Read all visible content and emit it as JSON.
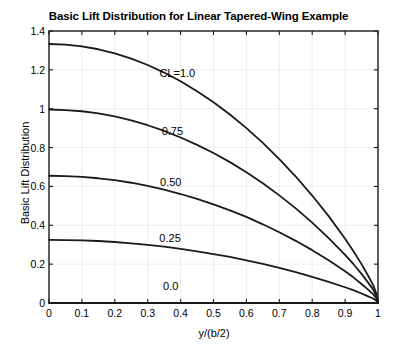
{
  "chart_data": {
    "type": "line",
    "title": "Basic Lift Distribution for Linear Tapered-Wing Example",
    "xlabel": "y/(b/2)",
    "ylabel": "Basic Lift Distribution",
    "xlim": [
      0,
      1
    ],
    "ylim": [
      0,
      1.4
    ],
    "xticks": [
      "0",
      "0.1",
      "0.2",
      "0.3",
      "0.4",
      "0.5",
      "0.6",
      "0.7",
      "0.8",
      "0.9",
      "1"
    ],
    "xtick_values": [
      0,
      0.1,
      0.2,
      0.3,
      0.4,
      0.5,
      0.6,
      0.7,
      0.8,
      0.9,
      1
    ],
    "yticks": [
      "0",
      "0.2",
      "0.4",
      "0.6",
      "0.8",
      "1",
      "1.2",
      "1.4"
    ],
    "ytick_values": [
      0,
      0.2,
      0.4,
      0.6,
      0.8,
      1.0,
      1.2,
      1.4
    ],
    "grid": true,
    "legend_position": "inline-annotations",
    "line_color": "#1a1a1a",
    "line_width": 1.8,
    "x": [
      0,
      0.05,
      0.1,
      0.15,
      0.2,
      0.25,
      0.3,
      0.35,
      0.4,
      0.45,
      0.5,
      0.55,
      0.6,
      0.65,
      0.7,
      0.75,
      0.8,
      0.85,
      0.9,
      0.925,
      0.95,
      0.97,
      0.985,
      0.995,
      1
    ],
    "series": [
      {
        "name": "CL=1.0",
        "label": "CL=1.0",
        "label_x": 0.39,
        "label_y": 1.185,
        "values": [
          1.333,
          1.33,
          1.321,
          1.306,
          1.285,
          1.258,
          1.225,
          1.186,
          1.141,
          1.09,
          1.033,
          0.97,
          0.9,
          0.824,
          0.741,
          0.651,
          0.553,
          0.447,
          0.331,
          0.268,
          0.2,
          0.14,
          0.093,
          0.048,
          0.0
        ]
      },
      {
        "name": "0.75",
        "label": "0.75",
        "label_x": 0.375,
        "label_y": 0.885,
        "values": [
          0.996,
          0.993,
          0.987,
          0.976,
          0.96,
          0.94,
          0.915,
          0.886,
          0.852,
          0.814,
          0.772,
          0.725,
          0.673,
          0.616,
          0.554,
          0.487,
          0.414,
          0.334,
          0.248,
          0.201,
          0.15,
          0.105,
          0.07,
          0.036,
          0.0
        ]
      },
      {
        "name": "0.50",
        "label": "0.50",
        "label_x": 0.37,
        "label_y": 0.625,
        "values": [
          0.655,
          0.653,
          0.649,
          0.642,
          0.632,
          0.619,
          0.603,
          0.583,
          0.561,
          0.536,
          0.508,
          0.477,
          0.443,
          0.405,
          0.364,
          0.32,
          0.272,
          0.22,
          0.163,
          0.132,
          0.098,
          0.069,
          0.046,
          0.024,
          0.0
        ]
      },
      {
        "name": "0.25",
        "label": "0.25",
        "label_x": 0.368,
        "label_y": 0.335,
        "values": [
          0.325,
          0.324,
          0.322,
          0.319,
          0.314,
          0.307,
          0.299,
          0.29,
          0.279,
          0.266,
          0.252,
          0.237,
          0.22,
          0.201,
          0.181,
          0.159,
          0.135,
          0.109,
          0.081,
          0.066,
          0.049,
          0.034,
          0.023,
          0.012,
          0.0
        ]
      },
      {
        "name": "0.0",
        "label": "0.0",
        "label_x": 0.37,
        "label_y": 0.085,
        "values": [
          0.0,
          0.0,
          0.0,
          0.0,
          0.0,
          0.0,
          0.0,
          0.0,
          0.0,
          0.0,
          0.0,
          0.0,
          0.0,
          0.0,
          0.0,
          0.0,
          0.0,
          0.0,
          0.0,
          0.0,
          0.0,
          0.0,
          0.0,
          0.0,
          0.0
        ]
      }
    ]
  }
}
